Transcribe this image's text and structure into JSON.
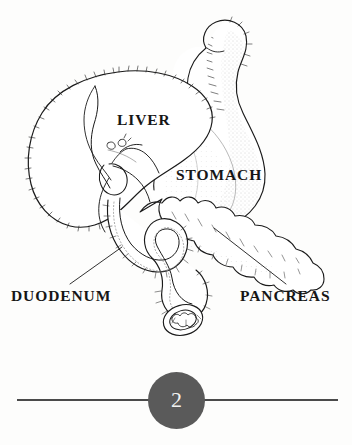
{
  "page": {
    "background_color": "#fdfdfc",
    "number": "2",
    "badge_color": "#5a5a5a",
    "rule_color": "#4a4a4a"
  },
  "figure": {
    "name": "anatomical-diagram-digestive-organs",
    "ink_color": "#1a1a1a",
    "labels": [
      {
        "id": "liver",
        "text": "LIVER"
      },
      {
        "id": "stomach",
        "text": "STOMACH"
      },
      {
        "id": "duodenum",
        "text": "DUODENUM"
      },
      {
        "id": "pancreas",
        "text": "PANCREAS"
      }
    ],
    "leader_lines": [
      {
        "id": "duodenum-leader",
        "from": [
          70,
          284
        ],
        "to": [
          122,
          247
        ]
      },
      {
        "id": "pancreas-leader",
        "from": [
          286,
          284
        ],
        "to": [
          214,
          228
        ]
      }
    ],
    "parts": [
      "liver-lobe",
      "gallbladder",
      "bile-duct",
      "stomach-body",
      "esophagus",
      "duodenum-loop",
      "duodenum-cut-end",
      "pancreas-head",
      "pancreas-tail"
    ]
  }
}
